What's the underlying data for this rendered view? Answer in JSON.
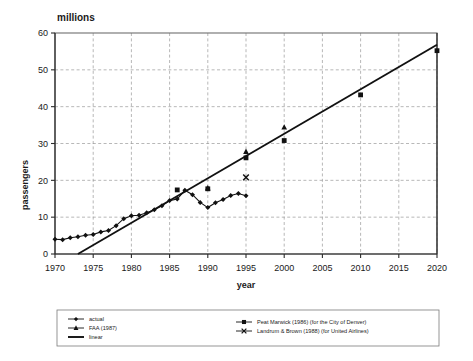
{
  "chart_data": {
    "type": "line",
    "title": "",
    "unit_label": "millions",
    "xlabel": "year",
    "ylabel": "passengers",
    "xlim": [
      1970,
      2020
    ],
    "ylim": [
      0,
      60
    ],
    "xticks": [
      1970,
      1975,
      1980,
      1985,
      1990,
      1995,
      2000,
      2005,
      2010,
      2015,
      2020
    ],
    "yticks": [
      0,
      10,
      20,
      30,
      40,
      50,
      60
    ],
    "xtick_labels": [
      "1970",
      "1975",
      "1980",
      "1985",
      "1990",
      "1995",
      "2000",
      "2005",
      "2010",
      "2015",
      "2020"
    ],
    "ytick_labels": [
      "0",
      "10",
      "20",
      "30",
      "40",
      "50",
      "60"
    ],
    "grid": true,
    "legend_position": "bottom",
    "series": [
      {
        "name": "actual",
        "marker": "diamond",
        "style": "line-marker",
        "x": [
          1970,
          1971,
          1972,
          1973,
          1974,
          1975,
          1976,
          1977,
          1978,
          1979,
          1980,
          1981,
          1982,
          1983,
          1984,
          1985,
          1986,
          1987,
          1988,
          1989,
          1990,
          1991,
          1992,
          1993,
          1994,
          1995
        ],
        "values": [
          4.0,
          3.9,
          4.4,
          4.7,
          5.1,
          5.3,
          6.0,
          6.4,
          7.7,
          9.6,
          10.4,
          10.5,
          11.2,
          12.0,
          13.1,
          14.5,
          14.9,
          17.3,
          16.1,
          14.0,
          12.6,
          13.9,
          14.8,
          15.9,
          16.4,
          15.8
        ]
      },
      {
        "name": "FAA (1987)",
        "marker": "triangle",
        "style": "markers",
        "x": [
          1990,
          1995,
          2000
        ],
        "values": [
          17.9,
          27.8,
          34.4
        ]
      },
      {
        "name": "linear",
        "marker": "none",
        "style": "line",
        "x": [
          1973,
          2020
        ],
        "values": [
          0,
          56.8
        ]
      },
      {
        "name": "Peat Marwick (1986) (for the City of Denver)",
        "marker": "square",
        "style": "markers",
        "x": [
          1986,
          1990,
          1995,
          2000,
          2010,
          2020
        ],
        "values": [
          17.4,
          17.7,
          26.1,
          30.8,
          43.2,
          55.2
        ]
      },
      {
        "name": "Landrum & Brown (1988) (for United Airlines)",
        "marker": "x",
        "style": "markers",
        "x": [
          1995
        ],
        "values": [
          20.8
        ]
      }
    ]
  },
  "legend": {
    "left_column": [
      {
        "label": "actual",
        "marker": "diamond"
      },
      {
        "label": "FAA (1987)",
        "marker": "triangle"
      },
      {
        "label": "linear",
        "marker": "line"
      }
    ],
    "right_column": [
      {
        "label": "Peat Marwick (1986) (for the City of Denver)",
        "marker": "square"
      },
      {
        "label": "Landrum & Brown (1988) (for United Airlines)",
        "marker": "x"
      }
    ]
  }
}
